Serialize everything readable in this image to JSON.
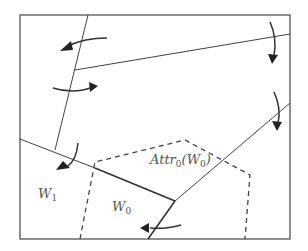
{
  "diagram": {
    "frame": {
      "x": 20,
      "y": 15,
      "width": 270,
      "height": 224
    },
    "labels": {
      "w1": {
        "main": "W",
        "sub": "1",
        "x": 38,
        "y": 198
      },
      "w0": {
        "main": "W",
        "sub": "0",
        "x": 112,
        "y": 211
      },
      "attr": {
        "prefix": "Attr",
        "sub": "0",
        "arg_open": "(W",
        "arg_sub": "0",
        "arg_close": ")",
        "x": 150,
        "y": 164
      }
    },
    "lines": {
      "solid": [
        {
          "name": "slanted-vertical-boundary",
          "x1": 88,
          "y1": 15,
          "x2": 55,
          "y2": 150
        },
        {
          "name": "upper-diagonal-boundary",
          "x1": 75,
          "y1": 70,
          "x2": 290,
          "y2": 34
        },
        {
          "name": "left-lower-boundary",
          "x1": 20,
          "y1": 139,
          "x2": 95,
          "y2": 168
        },
        {
          "name": "right-diagonal-boundary",
          "x1": 175,
          "y1": 201,
          "x2": 290,
          "y2": 103
        }
      ],
      "thick": [
        {
          "name": "attractor-boundary-top",
          "x1": 95,
          "y1": 168,
          "x2": 175,
          "y2": 201
        },
        {
          "name": "attractor-boundary-right",
          "x1": 175,
          "y1": 201,
          "x2": 148,
          "y2": 239
        }
      ],
      "dashed": [
        {
          "name": "attractor-region-outline",
          "points": "80,239 95,162 185,140 250,175 245,239"
        }
      ]
    },
    "arrows": [
      {
        "name": "arrow-top-left",
        "path": "M107,38 C90,38 78,41 68,46",
        "head": "60,51 71,41 73,50"
      },
      {
        "name": "arrow-mid-left",
        "path": "M53,88 C65,92 80,92 90,88",
        "head": "98,86 89,82 90,92"
      },
      {
        "name": "arrow-top-right",
        "path": "M270,22 C276,35 276,45 274,56",
        "head": "272,64 268,54 278,55"
      },
      {
        "name": "arrow-right",
        "path": "M274,92 C279,103 280,115 278,123",
        "head": "277,131 272,121 282,122"
      },
      {
        "name": "arrow-lower-left",
        "path": "M78,143 C77,155 74,162 67,167",
        "head": "56,170 63,161 70,168"
      },
      {
        "name": "arrow-bottom",
        "path": "M181,225 C170,228 160,229 150,228",
        "head": "140,228 149,223 149,233"
      }
    ]
  }
}
